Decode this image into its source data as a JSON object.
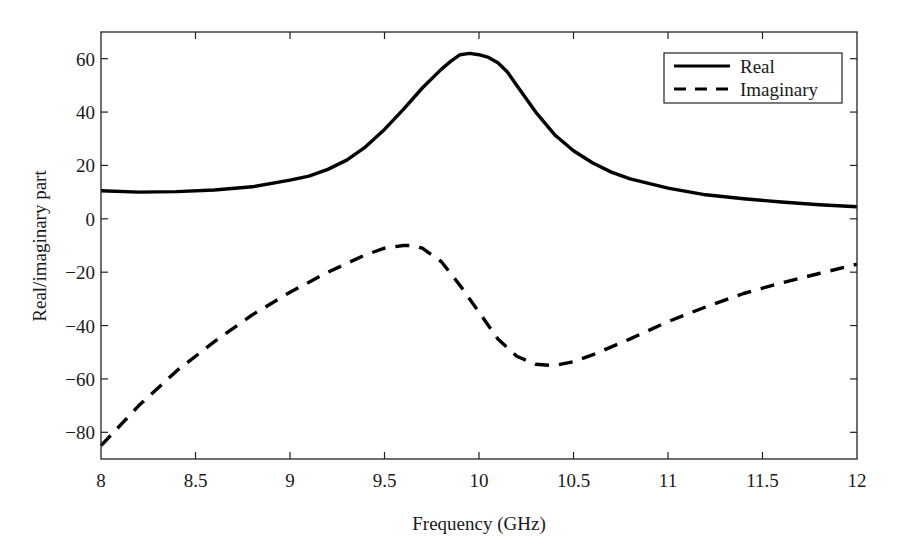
{
  "chart_data": {
    "type": "line",
    "title": "",
    "xlabel": "Frequency (GHz)",
    "ylabel": "Real/imaginary part",
    "xlim": [
      8,
      12
    ],
    "ylim": [
      -90,
      70
    ],
    "xticks": [
      8,
      8.5,
      9,
      9.5,
      10,
      10.5,
      11,
      11.5,
      12
    ],
    "xtick_labels": [
      "8",
      "8.5",
      "9",
      "9.5",
      "10",
      "10.5",
      "11",
      "11.5",
      "12"
    ],
    "yticks": [
      -80,
      -60,
      -40,
      -20,
      0,
      20,
      40,
      60
    ],
    "ytick_labels": [
      "−80",
      "−60",
      "−40",
      "−20",
      "0",
      "20",
      "40",
      "60"
    ],
    "grid": false,
    "legend_position": "upper right",
    "series": [
      {
        "name": "Real",
        "style": "solid",
        "color": "#000000",
        "x": [
          8.0,
          8.2,
          8.4,
          8.6,
          8.8,
          9.0,
          9.1,
          9.2,
          9.3,
          9.4,
          9.5,
          9.6,
          9.7,
          9.8,
          9.85,
          9.9,
          9.95,
          10.0,
          10.05,
          10.1,
          10.15,
          10.2,
          10.3,
          10.4,
          10.5,
          10.6,
          10.7,
          10.8,
          11.0,
          11.2,
          11.4,
          11.6,
          11.8,
          12.0
        ],
        "y": [
          10.5,
          10.0,
          10.2,
          10.8,
          12.0,
          14.5,
          16.0,
          18.5,
          22.0,
          27.0,
          33.5,
          41.0,
          49.0,
          56.0,
          59.0,
          61.5,
          62.0,
          61.5,
          60.5,
          58.5,
          55.0,
          50.0,
          40.0,
          31.5,
          25.5,
          21.0,
          17.5,
          15.0,
          11.5,
          9.0,
          7.5,
          6.3,
          5.3,
          4.5
        ]
      },
      {
        "name": "Imaginary",
        "style": "dashed",
        "color": "#000000",
        "x": [
          8.0,
          8.2,
          8.4,
          8.6,
          8.8,
          9.0,
          9.2,
          9.4,
          9.5,
          9.6,
          9.65,
          9.7,
          9.8,
          9.9,
          10.0,
          10.1,
          10.2,
          10.3,
          10.4,
          10.5,
          10.6,
          10.8,
          11.0,
          11.2,
          11.4,
          11.6,
          11.8,
          12.0
        ],
        "y": [
          -85.0,
          -70.0,
          -57.0,
          -46.0,
          -36.0,
          -27.5,
          -20.0,
          -13.5,
          -11.0,
          -10.0,
          -10.0,
          -11.0,
          -16.0,
          -25.0,
          -35.0,
          -45.0,
          -51.5,
          -54.5,
          -55.0,
          -53.5,
          -51.0,
          -45.0,
          -38.5,
          -33.0,
          -28.0,
          -24.0,
          -20.5,
          -17.0
        ]
      }
    ]
  }
}
